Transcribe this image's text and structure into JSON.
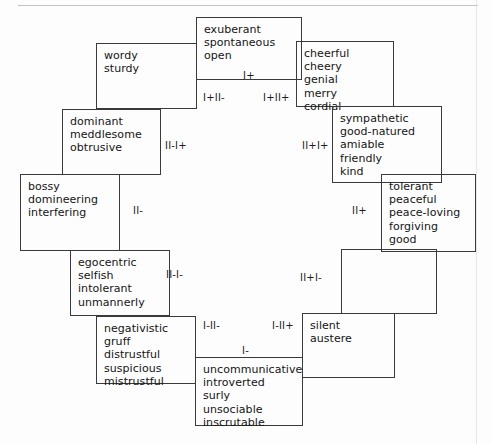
{
  "diagram": {
    "border_color": "#3a3a3a",
    "text_color": "#141414",
    "background": "#fdfdfd",
    "nodes": [
      {
        "name": "node-exuberant",
        "text": "exuberant\nspontaneous\nopen"
      },
      {
        "name": "node-cheerful",
        "text": "cheerful\ncheery\ngenial\nmerry\ncordial"
      },
      {
        "name": "node-sympathetic",
        "text": "sympathetic\ngood-natured\namiable\nfriendly\nkind"
      },
      {
        "name": "node-tolerant",
        "text": "tolerant\npeaceful\npeace-loving\nforgiving\ngood"
      },
      {
        "name": "node-blank-right",
        "text": ""
      },
      {
        "name": "node-silent",
        "text": "silent\naustere"
      },
      {
        "name": "node-uncommunicative",
        "text": "uncommunicative\nintroverted\nsurly\nunsociable\ninscrutable"
      },
      {
        "name": "node-negativistic",
        "text": "negativistic\ngruff\ndistrustful\nsuspicious\nmistrustful"
      },
      {
        "name": "node-egocentric",
        "text": "egocentric\nselfish\nintolerant\nunmannerly"
      },
      {
        "name": "node-bossy",
        "text": "bossy\ndomineering\ninterfering"
      },
      {
        "name": "node-dominant",
        "text": "dominant\nmeddlesome\nobtrusive"
      },
      {
        "name": "node-wordy",
        "text": "wordy\nsturdy"
      }
    ],
    "segment_labels": [
      {
        "name": "segment-label-i-plus",
        "text": "I+"
      },
      {
        "name": "segment-label-i-plus-ii-plus",
        "text": "I+II+"
      },
      {
        "name": "segment-label-ii-plus-i-plus",
        "text": "II+I+"
      },
      {
        "name": "segment-label-ii-plus",
        "text": "II+"
      },
      {
        "name": "segment-label-ii-plus-i-minus",
        "text": "II+I-"
      },
      {
        "name": "segment-label-i-minus-ii-plus",
        "text": "I-II+"
      },
      {
        "name": "segment-label-i-minus",
        "text": "I-"
      },
      {
        "name": "segment-label-i-minus-ii-minus",
        "text": "I-II-"
      },
      {
        "name": "segment-label-ii-minus-i-minus",
        "text": "II-I-"
      },
      {
        "name": "segment-label-ii-minus",
        "text": "II-"
      },
      {
        "name": "segment-label-ii-minus-i-plus",
        "text": "II-I+"
      },
      {
        "name": "segment-label-i-plus-ii-minus",
        "text": "I+II-"
      }
    ]
  }
}
